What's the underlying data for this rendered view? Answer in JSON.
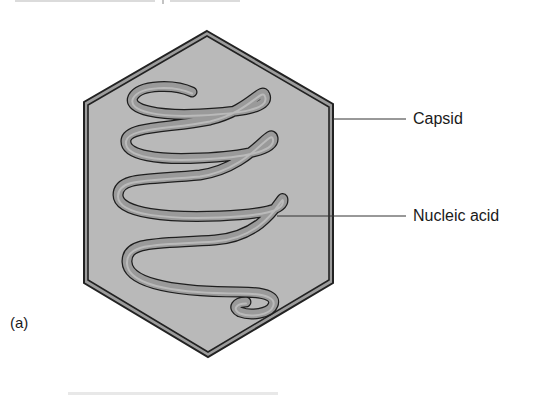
{
  "figure": {
    "panel_label": "(a)",
    "labels": {
      "capsid": "Capsid",
      "nucleic_acid": "Nucleic acid"
    }
  },
  "colors": {
    "background": "#ffffff",
    "capsid_fill": "#b9b9b9",
    "capsid_border_dark": "#222222",
    "capsid_border_mid": "#9c9c9c",
    "ribbon_fill": "#9a9a9a",
    "ribbon_highlight": "#c8c8c8",
    "ribbon_outline": "#1e1e1e",
    "leader_line": "#333333",
    "label_text": "#1a1a1a"
  }
}
